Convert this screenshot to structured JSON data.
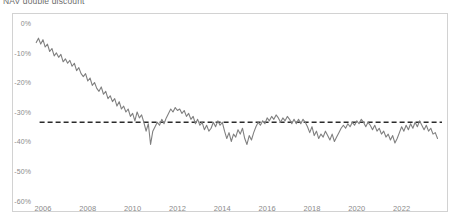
{
  "chart_data": {
    "type": "line",
    "title": "NAV double discount",
    "xlabel": "",
    "ylabel": "",
    "xlim": [
      2005.6,
      2023.8
    ],
    "ylim": [
      -60,
      2
    ],
    "grid": false,
    "legend": "none",
    "line_color": "#808080",
    "reference_line": {
      "label": "average discount",
      "value": -33,
      "style": "dashed",
      "color": "#2b2b2b"
    },
    "yticks": [
      0,
      -10,
      -20,
      -30,
      -40,
      -50,
      -60
    ],
    "ytick_labels": [
      "0%",
      "-10%",
      "-20%",
      "-30%",
      "-40%",
      "-50%",
      "-60%"
    ],
    "xticks": [
      2006,
      2008,
      2010,
      2012,
      2014,
      2016,
      2018,
      2020,
      2022
    ],
    "xtick_labels": [
      "2006",
      "2008",
      "2010",
      "2012",
      "2014",
      "2016",
      "2018",
      "2020",
      "2022"
    ],
    "series": [
      {
        "name": "NAV double discount",
        "x": [
          2005.7,
          2005.8,
          2005.9,
          2006.0,
          2006.1,
          2006.2,
          2006.3,
          2006.4,
          2006.5,
          2006.6,
          2006.7,
          2006.8,
          2006.9,
          2007.0,
          2007.1,
          2007.2,
          2007.3,
          2007.4,
          2007.5,
          2007.6,
          2007.7,
          2007.8,
          2007.9,
          2008.0,
          2008.1,
          2008.2,
          2008.3,
          2008.4,
          2008.5,
          2008.6,
          2008.7,
          2008.8,
          2008.9,
          2009.0,
          2009.1,
          2009.2,
          2009.3,
          2009.4,
          2009.5,
          2009.6,
          2009.7,
          2009.8,
          2009.9,
          2010.0,
          2010.1,
          2010.2,
          2010.3,
          2010.4,
          2010.5,
          2010.6,
          2010.7,
          2010.8,
          2010.9,
          2011.0,
          2011.1,
          2011.2,
          2011.3,
          2011.4,
          2011.5,
          2011.6,
          2011.7,
          2011.8,
          2011.9,
          2012.0,
          2012.1,
          2012.2,
          2012.3,
          2012.4,
          2012.5,
          2012.6,
          2012.7,
          2012.8,
          2012.9,
          2013.0,
          2013.1,
          2013.2,
          2013.3,
          2013.4,
          2013.5,
          2013.6,
          2013.7,
          2013.8,
          2013.9,
          2014.0,
          2014.1,
          2014.2,
          2014.3,
          2014.4,
          2014.5,
          2014.6,
          2014.7,
          2014.8,
          2014.9,
          2015.0,
          2015.1,
          2015.2,
          2015.3,
          2015.4,
          2015.5,
          2015.6,
          2015.7,
          2015.8,
          2015.9,
          2016.0,
          2016.1,
          2016.2,
          2016.3,
          2016.4,
          2016.5,
          2016.6,
          2016.7,
          2016.8,
          2016.9,
          2017.0,
          2017.1,
          2017.2,
          2017.3,
          2017.4,
          2017.5,
          2017.6,
          2017.7,
          2017.8,
          2017.9,
          2018.0,
          2018.1,
          2018.2,
          2018.3,
          2018.4,
          2018.5,
          2018.6,
          2018.7,
          2018.8,
          2018.9,
          2019.0,
          2019.1,
          2019.2,
          2019.3,
          2019.4,
          2019.5,
          2019.6,
          2019.7,
          2019.8,
          2019.9,
          2020.0,
          2020.1,
          2020.2,
          2020.3,
          2020.4,
          2020.5,
          2020.6,
          2020.7,
          2020.8,
          2020.9,
          2021.0,
          2021.1,
          2021.2,
          2021.3,
          2021.4,
          2021.5,
          2021.6,
          2021.7,
          2021.8,
          2021.9,
          2022.0,
          2022.1,
          2022.2,
          2022.3,
          2022.4,
          2022.5,
          2022.6,
          2022.7,
          2022.8,
          2022.9,
          2023.0,
          2023.1,
          2023.2,
          2023.3,
          2023.4,
          2023.5,
          2023.6
        ],
        "y": [
          -6.0,
          -4.5,
          -6.5,
          -5.0,
          -7.5,
          -6.5,
          -9.0,
          -8.0,
          -10.5,
          -9.5,
          -11.0,
          -10.0,
          -12.5,
          -11.5,
          -13.0,
          -12.0,
          -14.0,
          -13.0,
          -15.5,
          -14.5,
          -16.5,
          -17.5,
          -16.5,
          -19.0,
          -18.0,
          -20.5,
          -19.5,
          -21.5,
          -22.5,
          -21.0,
          -23.5,
          -22.5,
          -25.0,
          -24.0,
          -26.0,
          -25.0,
          -27.5,
          -26.0,
          -28.5,
          -27.5,
          -29.5,
          -28.5,
          -31.0,
          -30.0,
          -32.5,
          -29.5,
          -31.5,
          -30.5,
          -33.0,
          -36.0,
          -33.5,
          -40.5,
          -36.0,
          -34.5,
          -33.0,
          -34.0,
          -32.0,
          -33.5,
          -31.5,
          -30.0,
          -28.5,
          -29.5,
          -28.0,
          -29.0,
          -28.5,
          -30.0,
          -29.0,
          -31.0,
          -30.0,
          -32.0,
          -31.0,
          -33.5,
          -32.0,
          -34.0,
          -33.0,
          -35.5,
          -34.0,
          -36.0,
          -35.0,
          -33.0,
          -34.5,
          -32.5,
          -34.0,
          -33.0,
          -36.0,
          -38.5,
          -36.5,
          -39.5,
          -37.0,
          -38.0,
          -35.5,
          -37.0,
          -35.0,
          -38.5,
          -40.5,
          -37.5,
          -39.0,
          -36.5,
          -34.5,
          -33.0,
          -34.0,
          -32.5,
          -33.5,
          -31.5,
          -32.5,
          -31.0,
          -32.0,
          -30.5,
          -31.5,
          -33.0,
          -31.5,
          -32.5,
          -31.0,
          -32.0,
          -33.5,
          -32.0,
          -33.5,
          -32.0,
          -33.5,
          -32.0,
          -33.0,
          -34.5,
          -36.5,
          -34.5,
          -37.5,
          -36.0,
          -38.5,
          -37.0,
          -38.0,
          -36.0,
          -37.5,
          -39.0,
          -37.0,
          -39.5,
          -38.0,
          -36.5,
          -35.0,
          -34.0,
          -35.0,
          -33.5,
          -34.5,
          -33.0,
          -34.0,
          -32.5,
          -33.5,
          -32.0,
          -33.0,
          -34.5,
          -33.0,
          -34.0,
          -35.5,
          -34.0,
          -36.0,
          -35.0,
          -37.0,
          -36.0,
          -38.0,
          -37.0,
          -39.0,
          -37.5,
          -40.0,
          -38.5,
          -36.5,
          -34.5,
          -36.0,
          -34.0,
          -35.5,
          -33.5,
          -35.0,
          -33.0,
          -34.5,
          -32.5,
          -34.0,
          -35.5,
          -34.0,
          -36.0,
          -35.0,
          -37.0,
          -36.5,
          -38.5
        ]
      }
    ],
    "annotations": [
      {
        "text": "steep decline 2006-2010",
        "x": 2008,
        "y": -25
      },
      {
        "text": "2008 crisis trough",
        "x": 2008.8,
        "y": -40.5
      },
      {
        "text": "2020 COVID trough",
        "x": 2020.4,
        "y": -52.5
      },
      {
        "text": "2022-2023 widening",
        "x": 2023.0,
        "y": -50
      }
    ]
  }
}
